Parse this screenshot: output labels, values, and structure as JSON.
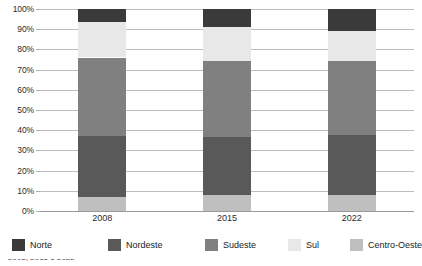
{
  "chart_data": {
    "type": "bar",
    "title": "",
    "subtitle": "",
    "xlabel": "",
    "ylabel": "",
    "stacked": true,
    "normalized": "100%",
    "grid": true,
    "legend_position": "bottom",
    "ylim": [
      0,
      100
    ],
    "categories": [
      "2008",
      "2015",
      "2022"
    ],
    "y_ticks": [
      "0%",
      "10%",
      "20%",
      "30%",
      "40%",
      "50%",
      "60%",
      "70%",
      "80%",
      "90%",
      "100%"
    ],
    "y_tick_values": [
      0,
      10,
      20,
      30,
      40,
      50,
      60,
      70,
      80,
      90,
      100
    ],
    "stack_order_bottom_to_top": [
      "Centro-Oeste",
      "Nordeste",
      "Sudeste",
      "Sul",
      "Norte"
    ],
    "series": [
      {
        "name": "Norte",
        "color": "#3a3a3a",
        "values": [
          6.5,
          9.0,
          11.0
        ]
      },
      {
        "name": "Nordeste",
        "color": "#595959",
        "values": [
          30.0,
          28.5,
          29.5
        ]
      },
      {
        "name": "Sudeste",
        "color": "#808080",
        "values": [
          39.0,
          38.0,
          37.0
        ]
      },
      {
        "name": "Sul",
        "color": "#e8e8e8",
        "values": [
          17.5,
          16.5,
          14.5
        ]
      },
      {
        "name": "Centro-Oeste",
        "color": "#bfbfbf",
        "values": [
          7.0,
          8.0,
          8.0
        ]
      }
    ]
  },
  "legend": {
    "items": [
      {
        "label": "Norte"
      },
      {
        "label": "Nordeste"
      },
      {
        "label": "Sudeste"
      },
      {
        "label": "Sul"
      },
      {
        "label": "Centro-Oeste"
      }
    ]
  },
  "caption": {
    "clipped_text": "2008, 2015 e 2022"
  }
}
